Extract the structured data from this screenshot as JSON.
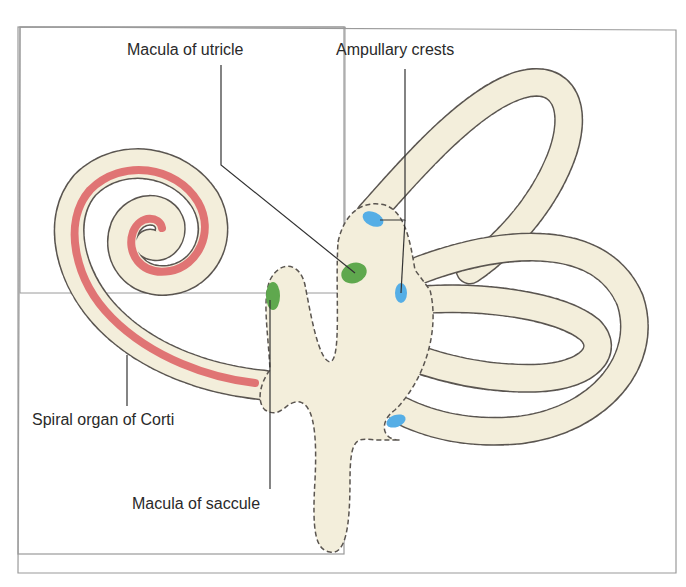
{
  "diagram": {
    "type": "anatomical-illustration",
    "labels": {
      "macula_utricle": "Macula of utricle",
      "ampullary_crests": "Ampullary crests",
      "spiral_organ": "Spiral organ of Corti",
      "macula_saccule": "Macula of saccule"
    },
    "colors": {
      "labyrinth_fill": "#f3eedb",
      "outline_dashed": "#5a5550",
      "spiral_organ": "#e07474",
      "macula": "#5fa84e",
      "ampullary_crest": "#55aee6",
      "leader_line": "#333333",
      "frame_border": "#9a9a9a"
    }
  }
}
